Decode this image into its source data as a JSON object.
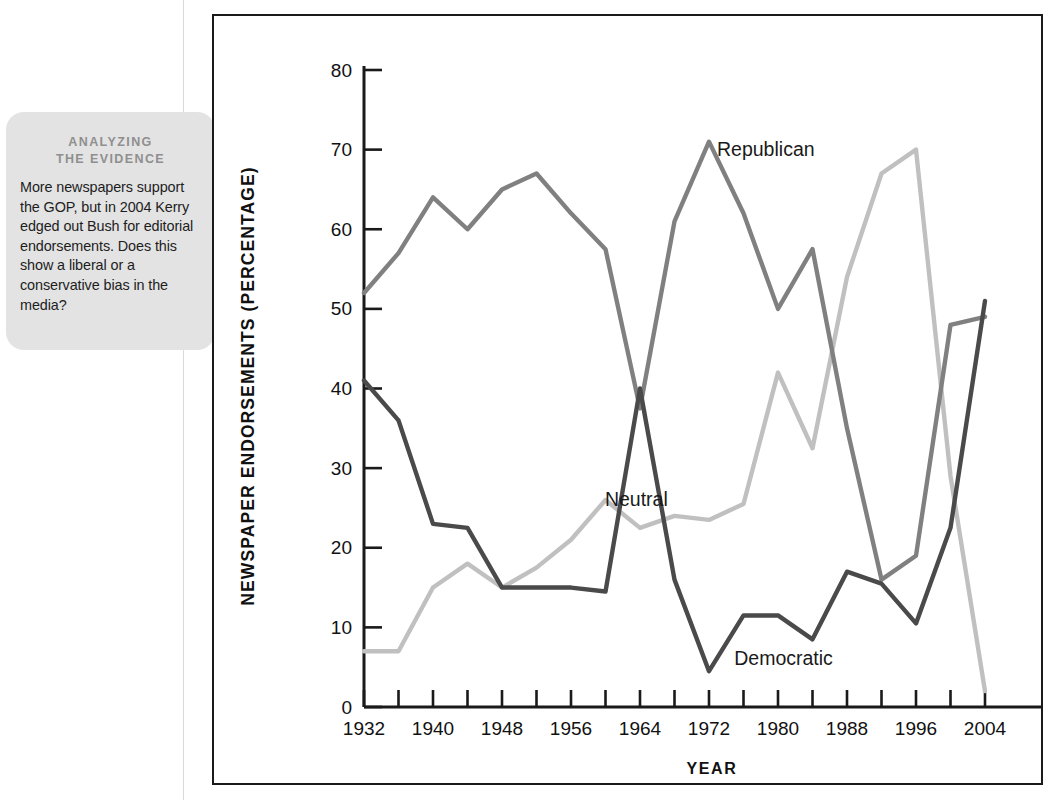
{
  "callout": {
    "heading_line1": "ANALYZING",
    "heading_line2": "THE EVIDENCE",
    "body": "More newspapers support the GOP, but in 2004 Kerry edged out Bush for editorial endorsements. Does this show a liberal or a conservative bias in the media?",
    "fill_color": "#e3e3e3",
    "heading_color": "#8f8f8f"
  },
  "chart_data": {
    "type": "line",
    "title": "",
    "xlabel": "YEAR",
    "ylabel": "NEWSPAPER ENDORSEMENTS (PERCENTAGE)",
    "xlim": [
      1932,
      2004
    ],
    "ylim": [
      0,
      80
    ],
    "yticks": [
      0,
      10,
      20,
      30,
      40,
      50,
      60,
      70,
      80
    ],
    "ytick_labels": [
      "0",
      "10",
      "20",
      "30",
      "40",
      "50",
      "60",
      "70",
      "80"
    ],
    "xticks": [
      1932,
      1936,
      1940,
      1944,
      1948,
      1952,
      1956,
      1960,
      1964,
      1968,
      1972,
      1976,
      1980,
      1984,
      1988,
      1992,
      1996,
      2000,
      2004
    ],
    "xtick_labels": [
      "1932",
      "",
      "1940",
      "",
      "1948",
      "",
      "1956",
      "",
      "1964",
      "",
      "1972",
      "",
      "1980",
      "",
      "1988",
      "",
      "1996",
      "",
      "2004"
    ],
    "xtick_labels_shown": [
      "1932",
      "1940",
      "1948",
      "1956",
      "1964",
      "1972",
      "1980",
      "1988",
      "1996",
      "2004"
    ],
    "grid": false,
    "legend_position": "inline-annotations",
    "x": [
      1932,
      1936,
      1940,
      1944,
      1948,
      1952,
      1956,
      1960,
      1964,
      1968,
      1972,
      1976,
      1980,
      1984,
      1988,
      1992,
      1996,
      2000,
      2004
    ],
    "series": [
      {
        "name": "Republican",
        "color": "#808080",
        "label_x": 1972,
        "label_y": 70,
        "values": [
          52,
          57,
          64,
          60,
          65,
          67,
          62,
          57.5,
          37.5,
          61,
          71,
          62,
          50,
          57.5,
          35,
          16,
          19,
          48,
          49
        ]
      },
      {
        "name": "Democratic",
        "color": "#4a4a4a",
        "label_x": 1974,
        "label_y": 6,
        "values": [
          41,
          36,
          23,
          22.5,
          15,
          15,
          15,
          14.5,
          40,
          16,
          4.5,
          11.5,
          11.5,
          8.5,
          17,
          15.5,
          10.5,
          22.5,
          51
        ]
      },
      {
        "name": "Neutral",
        "color": "#c0c0c0",
        "label_x": 1959,
        "label_y": 26,
        "values": [
          7,
          7,
          15,
          18,
          15,
          17.5,
          21,
          26,
          22.5,
          24,
          23.5,
          25.5,
          42,
          32.5,
          54,
          67,
          70,
          29,
          2
        ]
      }
    ]
  }
}
